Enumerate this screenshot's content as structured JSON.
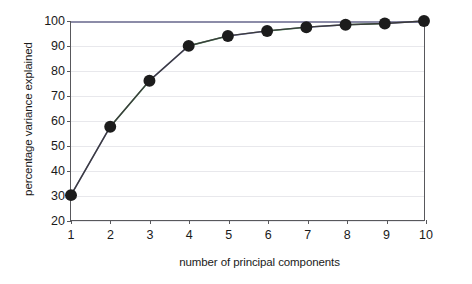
{
  "chart_data": {
    "type": "line",
    "title": "",
    "xlabel": "number of principal components",
    "ylabel": "percentage variance explained",
    "x": [
      1,
      2,
      3,
      4,
      5,
      6,
      7,
      8,
      9,
      10
    ],
    "xtick_labels": [
      "1",
      "2",
      "3",
      "4",
      "5",
      "6",
      "7",
      "8",
      "9",
      "10"
    ],
    "ytick_labels": [
      "20",
      "30",
      "40",
      "50",
      "60",
      "70",
      "80",
      "90",
      "100"
    ],
    "yticks": [
      20,
      30,
      40,
      50,
      60,
      70,
      80,
      90,
      100
    ],
    "xlim": [
      1,
      10
    ],
    "ylim": [
      20,
      100
    ],
    "grid": "horizontal",
    "legend": "none",
    "series": [
      {
        "name": "cumulative percentage variance explained",
        "values": [
          30,
          57.5,
          76,
          90,
          94,
          96,
          97.5,
          98.5,
          99,
          100
        ],
        "marker": "filled-circle",
        "marker_color": "#1c1c1c",
        "line_color": "#3b3b3b"
      },
      {
        "name": "overlay trace",
        "values": [
          30,
          57.5,
          76,
          90,
          94,
          96,
          97.5,
          98.5,
          99,
          100
        ],
        "marker": "none",
        "line_color": "#6d6da0"
      }
    ],
    "colors": {
      "marker": "#1c1c1c",
      "line": "#3b3b3b",
      "overlay_blue": "#6d6da0",
      "overlay_green": "#4e8a5a",
      "axis": "#58585c",
      "grid": "#e8e8ec",
      "top_border": "#8c8ca8",
      "background": "#ffffff",
      "text": "#1a1a1a"
    }
  }
}
